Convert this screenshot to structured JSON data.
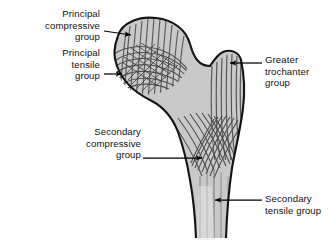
{
  "figure": {
    "background_color": "#ffffff",
    "bone_fill_color": "#c9c9c9",
    "bone_outline_color": "#1a1a1a",
    "trabecula_color": "#4a4a4a",
    "label_color": "#111111",
    "leader_color": "#000000"
  },
  "labels": [
    {
      "id": "principal-compressive-group",
      "lines": [
        "Principal",
        "compressive",
        "group"
      ],
      "align": "right",
      "x": 8,
      "y": 8,
      "width": 92
    },
    {
      "id": "principal-tensile-group",
      "lines": [
        "Principal",
        "tensile",
        "group"
      ],
      "align": "right",
      "x": 8,
      "y": 47,
      "width": 92
    },
    {
      "id": "greater-trochanter-group",
      "lines": [
        "Greater",
        "trochanter",
        "group"
      ],
      "align": "left",
      "x": 265,
      "y": 54,
      "width": 62
    },
    {
      "id": "secondary-compressive-group",
      "lines": [
        "Secondary",
        "compressive",
        "group"
      ],
      "align": "right",
      "x": 48,
      "y": 126,
      "width": 93
    },
    {
      "id": "secondary-tensile-group",
      "lines": [
        "Secondary",
        "tensile group"
      ],
      "align": "left",
      "x": 265,
      "y": 197,
      "width": 62
    }
  ],
  "leaders": [
    {
      "id": "leader-principal-compressive",
      "from_x": 104,
      "from_y": 31,
      "to_x": 133,
      "to_y": 35,
      "arrow": true
    },
    {
      "id": "leader-principal-tensile",
      "from_x": 104,
      "from_y": 74,
      "to_x": 124,
      "to_y": 74,
      "arrow": true
    },
    {
      "id": "leader-greater-trochanter",
      "from_x": 262,
      "from_y": 63,
      "to_x": 228,
      "to_y": 63,
      "arrow": true
    },
    {
      "id": "leader-secondary-compressive",
      "from_x": 143,
      "from_y": 158,
      "to_x": 204,
      "to_y": 158,
      "arrow": true
    },
    {
      "id": "leader-secondary-tensile",
      "from_x": 262,
      "from_y": 200,
      "to_x": 213,
      "to_y": 200,
      "arrow": true
    }
  ]
}
